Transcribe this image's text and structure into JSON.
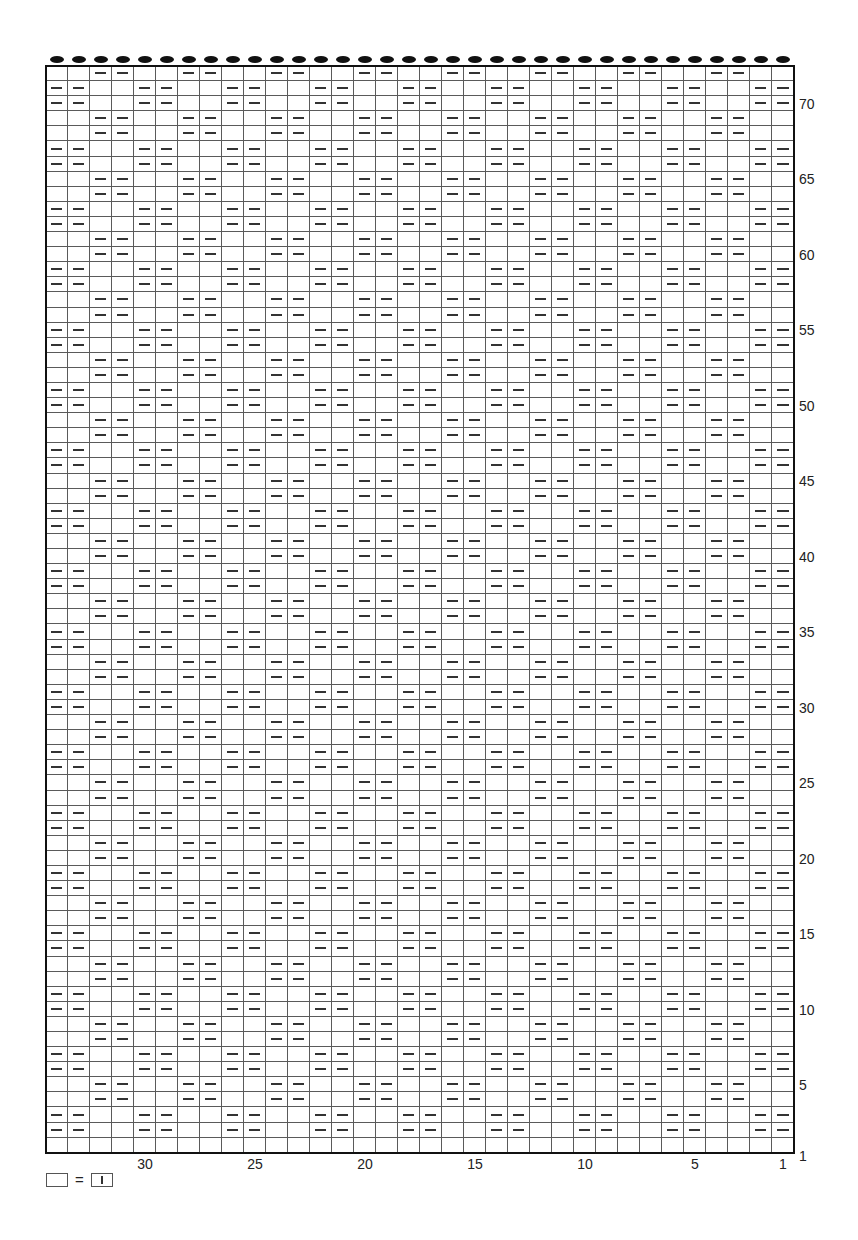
{
  "chart_data": {
    "type": "knitting-chart",
    "columns": 34,
    "rows": 72,
    "column_numbering": "right-to-left",
    "row_numbering": "bottom-to-top",
    "column_labels": [
      1,
      5,
      10,
      15,
      20,
      25,
      30
    ],
    "row_labels": [
      1,
      5,
      10,
      15,
      20,
      25,
      30,
      35,
      40,
      45,
      50,
      55,
      60,
      65,
      70
    ],
    "top_markers": "one dot per column (34)",
    "symbols": {
      "blank": "knit (see legend)",
      "dash": "purl"
    },
    "repeat": {
      "width": 4,
      "height": 4,
      "description": "Row 1 all blank. From row 2 upward, rows pair up: rows 2-3 purl in cols 1-2 of each 4-col repeat, rows 4-5 purl in cols 3-4, alternating every 2 rows.",
      "first_pattern_row": 2,
      "pair_a_purl_cols_mod4": [
        1,
        2
      ],
      "pair_b_purl_cols_mod4": [
        3,
        0
      ]
    }
  },
  "legend": {
    "left_symbol": "blank-box",
    "equals": "=",
    "right_symbol": "knit-box-vertical-bar"
  },
  "colors": {
    "border": "#111111",
    "gridline": "#5a5a5a",
    "purl_dash": "#333333",
    "dot": "#111111"
  }
}
